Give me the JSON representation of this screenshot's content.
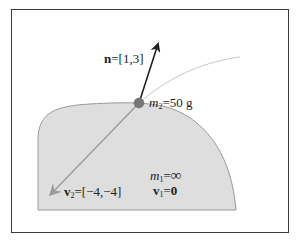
{
  "diagram": {
    "normal_vector": {
      "symbol": "n",
      "equals": "=",
      "value": "[1,3]"
    },
    "small_mass": {
      "symbol": "m",
      "subscript": "2",
      "equals": "=",
      "value": "50 g"
    },
    "small_velocity": {
      "symbol": "v",
      "subscript": "2",
      "equals": "=",
      "value": "[−4,−4]"
    },
    "large_mass": {
      "symbol": "m",
      "subscript": "1",
      "equals": "=",
      "value": "∞"
    },
    "large_velocity": {
      "symbol": "v",
      "subscript": "1",
      "equals": "=",
      "value": "0"
    },
    "colors": {
      "surface_fill": "#dedede",
      "surface_stroke": "#9a9a9a",
      "normal_arrow": "#222222",
      "velocity_arrow": "#9a9a9a",
      "trajectory": "#c8c8c8",
      "ball": "#777777",
      "frame": "#3a3a3a"
    }
  }
}
